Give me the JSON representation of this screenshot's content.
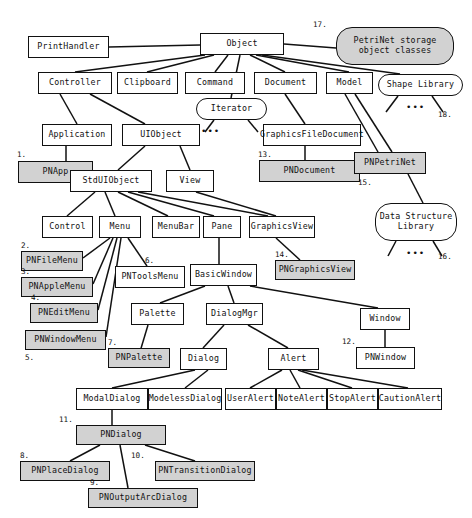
{
  "diagram": {
    "colors": {
      "highlight_fill": "#d2d2d2",
      "plain_fill": "#ffffff",
      "stroke": "#111111"
    },
    "nodes": [
      {
        "id": "PrintHandler",
        "label": "PrintHandler",
        "x": 28,
        "y": 36,
        "w": 81,
        "h": 22,
        "shape": "rect",
        "fill": "plain"
      },
      {
        "id": "Object",
        "label": "Object",
        "x": 200,
        "y": 33,
        "w": 84,
        "h": 22,
        "shape": "rect",
        "fill": "plain"
      },
      {
        "id": "PNStorage",
        "label": "PetriNet storage\nobject classes",
        "x": 336,
        "y": 27,
        "w": 118,
        "h": 38,
        "shape": "round2",
        "fill": "gray"
      },
      {
        "id": "Controller",
        "label": "Controller",
        "x": 38,
        "y": 72,
        "w": 74,
        "h": 22,
        "shape": "rect",
        "fill": "plain"
      },
      {
        "id": "Clipboard",
        "label": "Clipboard",
        "x": 117,
        "y": 72,
        "w": 61,
        "h": 22,
        "shape": "rect",
        "fill": "plain"
      },
      {
        "id": "Command",
        "label": "Command",
        "x": 185,
        "y": 72,
        "w": 60,
        "h": 22,
        "shape": "rect",
        "fill": "plain"
      },
      {
        "id": "Document",
        "label": "Document",
        "x": 254,
        "y": 72,
        "w": 63,
        "h": 22,
        "shape": "rect",
        "fill": "plain"
      },
      {
        "id": "Model",
        "label": "Model",
        "x": 326,
        "y": 72,
        "w": 47,
        "h": 22,
        "shape": "rect",
        "fill": "plain"
      },
      {
        "id": "ShapeLibrary",
        "label": "Shape Library",
        "x": 378,
        "y": 74,
        "w": 85,
        "h": 22,
        "shape": "round",
        "fill": "plain"
      },
      {
        "id": "Iterator",
        "label": "Iterator",
        "x": 196,
        "y": 98,
        "w": 71,
        "h": 22,
        "shape": "round",
        "fill": "plain"
      },
      {
        "id": "Application",
        "label": "Application",
        "x": 42,
        "y": 124,
        "w": 70,
        "h": 22,
        "shape": "rect",
        "fill": "plain"
      },
      {
        "id": "UIObject",
        "label": "UIObject",
        "x": 122,
        "y": 124,
        "w": 78,
        "h": 22,
        "shape": "rect",
        "fill": "plain"
      },
      {
        "id": "GraphicsFileDocument",
        "label": "GraphicsFileDocument",
        "x": 263,
        "y": 124,
        "w": 98,
        "h": 22,
        "shape": "rect",
        "fill": "plain"
      },
      {
        "id": "PNApp",
        "label": "PNApp",
        "x": 18,
        "y": 161,
        "w": 75,
        "h": 22,
        "shape": "rect",
        "fill": "gray"
      },
      {
        "id": "StdUIObject",
        "label": "StdUIObject",
        "x": 70,
        "y": 170,
        "w": 82,
        "h": 22,
        "shape": "rect",
        "fill": "plain"
      },
      {
        "id": "View",
        "label": "View",
        "x": 166,
        "y": 170,
        "w": 48,
        "h": 22,
        "shape": "rect",
        "fill": "plain"
      },
      {
        "id": "PNDocument",
        "label": "PNDocument",
        "x": 259,
        "y": 160,
        "w": 101,
        "h": 22,
        "shape": "rect",
        "fill": "gray"
      },
      {
        "id": "PNPetriNet",
        "label": "PNPetriNet",
        "x": 354,
        "y": 152,
        "w": 72,
        "h": 22,
        "shape": "rect",
        "fill": "gray"
      },
      {
        "id": "DataStructureLibrary",
        "label": "Data Structure\nLibrary",
        "x": 375,
        "y": 203,
        "w": 82,
        "h": 38,
        "shape": "round2",
        "fill": "plain"
      },
      {
        "id": "Control",
        "label": "Control",
        "x": 42,
        "y": 216,
        "w": 51,
        "h": 22,
        "shape": "rect",
        "fill": "plain"
      },
      {
        "id": "Menu",
        "label": "Menu",
        "x": 99,
        "y": 216,
        "w": 42,
        "h": 22,
        "shape": "rect",
        "fill": "plain"
      },
      {
        "id": "MenuBar",
        "label": "MenuBar",
        "x": 152,
        "y": 216,
        "w": 48,
        "h": 22,
        "shape": "rect",
        "fill": "plain"
      },
      {
        "id": "Pane",
        "label": "Pane",
        "x": 203,
        "y": 216,
        "w": 38,
        "h": 22,
        "shape": "rect",
        "fill": "plain"
      },
      {
        "id": "GraphicsView",
        "label": "GraphicsView",
        "x": 249,
        "y": 216,
        "w": 66,
        "h": 22,
        "shape": "rect",
        "fill": "plain"
      },
      {
        "id": "PNFileMenu",
        "label": "PNFileMenu",
        "x": 21,
        "y": 251,
        "w": 62,
        "h": 20,
        "shape": "rect",
        "fill": "gray"
      },
      {
        "id": "PNToolsMenu",
        "label": "PNToolsMenu",
        "x": 115,
        "y": 266,
        "w": 70,
        "h": 22,
        "shape": "rect",
        "fill": "plain"
      },
      {
        "id": "BasicWindow",
        "label": "BasicWindow",
        "x": 190,
        "y": 264,
        "w": 67,
        "h": 22,
        "shape": "rect",
        "fill": "plain"
      },
      {
        "id": "PNGraphicsView",
        "label": "PNGraphicsView",
        "x": 275,
        "y": 260,
        "w": 80,
        "h": 20,
        "shape": "rect",
        "fill": "gray"
      },
      {
        "id": "PNAppleMenu",
        "label": "PNAppleMenu",
        "x": 21,
        "y": 277,
        "w": 72,
        "h": 20,
        "shape": "rect",
        "fill": "gray"
      },
      {
        "id": "PNEditMenu",
        "label": "PNEditMenu",
        "x": 30,
        "y": 303,
        "w": 68,
        "h": 20,
        "shape": "rect",
        "fill": "gray"
      },
      {
        "id": "Palette",
        "label": "Palette",
        "x": 131,
        "y": 303,
        "w": 53,
        "h": 22,
        "shape": "rect",
        "fill": "plain"
      },
      {
        "id": "DialogMgr",
        "label": "DialogMgr",
        "x": 206,
        "y": 303,
        "w": 57,
        "h": 22,
        "shape": "rect",
        "fill": "plain"
      },
      {
        "id": "Window",
        "label": "Window",
        "x": 360,
        "y": 308,
        "w": 50,
        "h": 22,
        "shape": "rect",
        "fill": "plain"
      },
      {
        "id": "PNWindowMenu",
        "label": "PNWindowMenu",
        "x": 25,
        "y": 330,
        "w": 81,
        "h": 20,
        "shape": "rect",
        "fill": "gray"
      },
      {
        "id": "PNPalette",
        "label": "PNPalette",
        "x": 108,
        "y": 348,
        "w": 62,
        "h": 20,
        "shape": "rect",
        "fill": "gray"
      },
      {
        "id": "Dialog",
        "label": "Dialog",
        "x": 180,
        "y": 348,
        "w": 47,
        "h": 22,
        "shape": "rect",
        "fill": "plain"
      },
      {
        "id": "Alert",
        "label": "Alert",
        "x": 268,
        "y": 348,
        "w": 51,
        "h": 22,
        "shape": "rect",
        "fill": "plain"
      },
      {
        "id": "PNWindow",
        "label": "PNWindow",
        "x": 356,
        "y": 347,
        "w": 59,
        "h": 22,
        "shape": "rect",
        "fill": "plain"
      },
      {
        "id": "ModalDialog",
        "label": "ModalDialog",
        "x": 76,
        "y": 388,
        "w": 72,
        "h": 22,
        "shape": "rect",
        "fill": "plain"
      },
      {
        "id": "ModelessDialog",
        "label": "ModelessDialog",
        "x": 148,
        "y": 388,
        "w": 74,
        "h": 22,
        "shape": "rect",
        "fill": "plain"
      },
      {
        "id": "UserAlert",
        "label": "UserAlert",
        "x": 225,
        "y": 388,
        "w": 51,
        "h": 22,
        "shape": "rect",
        "fill": "plain"
      },
      {
        "id": "NoteAlert",
        "label": "NoteAlert",
        "x": 276,
        "y": 388,
        "w": 51,
        "h": 22,
        "shape": "rect",
        "fill": "plain"
      },
      {
        "id": "StopAlert",
        "label": "StopAlert",
        "x": 327,
        "y": 388,
        "w": 51,
        "h": 22,
        "shape": "rect",
        "fill": "plain"
      },
      {
        "id": "CautionAlert",
        "label": "CautionAlert",
        "x": 378,
        "y": 388,
        "w": 64,
        "h": 22,
        "shape": "rect",
        "fill": "plain"
      },
      {
        "id": "PNDialog",
        "label": "PNDialog",
        "x": 76,
        "y": 425,
        "w": 90,
        "h": 20,
        "shape": "rect",
        "fill": "gray"
      },
      {
        "id": "PNPlaceDialog",
        "label": "PNPlaceDialog",
        "x": 20,
        "y": 461,
        "w": 90,
        "h": 20,
        "shape": "rect",
        "fill": "gray"
      },
      {
        "id": "PNTransitionDialog",
        "label": "PNTransitionDialog",
        "x": 155,
        "y": 461,
        "w": 100,
        "h": 20,
        "shape": "rect",
        "fill": "gray"
      },
      {
        "id": "PNOutputArcDialog",
        "label": "PNOutputArcDialog",
        "x": 88,
        "y": 488,
        "w": 110,
        "h": 20,
        "shape": "rect",
        "fill": "gray"
      }
    ],
    "number_labels": [
      {
        "text": "1.",
        "x": 17,
        "y": 150
      },
      {
        "text": "2.",
        "x": 21,
        "y": 241
      },
      {
        "text": "3.",
        "x": 21,
        "y": 267
      },
      {
        "text": "4.",
        "x": 31,
        "y": 293
      },
      {
        "text": "5.",
        "x": 25,
        "y": 353
      },
      {
        "text": "6.",
        "x": 145,
        "y": 256
      },
      {
        "text": "7.",
        "x": 108,
        "y": 338
      },
      {
        "text": "8.",
        "x": 20,
        "y": 451
      },
      {
        "text": "9.",
        "x": 90,
        "y": 478
      },
      {
        "text": "10.",
        "x": 131,
        "y": 451
      },
      {
        "text": "11.",
        "x": 59,
        "y": 415
      },
      {
        "text": "12.",
        "x": 342,
        "y": 337
      },
      {
        "text": "13.",
        "x": 258,
        "y": 150
      },
      {
        "text": "14.",
        "x": 275,
        "y": 250
      },
      {
        "text": "15.",
        "x": 358,
        "y": 178
      },
      {
        "text": "16.",
        "x": 438,
        "y": 252
      },
      {
        "text": "17.",
        "x": 313,
        "y": 20
      },
      {
        "text": "18.",
        "x": 438,
        "y": 110
      }
    ],
    "ellipses_markers": [
      {
        "text": "•••",
        "x": 201,
        "y": 126
      },
      {
        "text": "•••",
        "x": 406,
        "y": 102
      },
      {
        "text": "•••",
        "x": 406,
        "y": 248
      }
    ],
    "edges": [
      {
        "from": "Object",
        "to": "PrintHandler",
        "x1": 200,
        "y1": 45,
        "x2": 109,
        "y2": 47
      },
      {
        "from": "Object",
        "to": "Controller",
        "x1": 205,
        "y1": 55,
        "x2": 75,
        "y2": 72
      },
      {
        "from": "Object",
        "to": "Clipboard",
        "x1": 214,
        "y1": 55,
        "x2": 147,
        "y2": 72
      },
      {
        "from": "Object",
        "to": "Command",
        "x1": 228,
        "y1": 55,
        "x2": 215,
        "y2": 72
      },
      {
        "from": "Object",
        "to": "Iterator",
        "x1": 240,
        "y1": 55,
        "x2": 231,
        "y2": 98
      },
      {
        "from": "Object",
        "to": "Document",
        "x1": 250,
        "y1": 55,
        "x2": 285,
        "y2": 72
      },
      {
        "from": "Object",
        "to": "Model",
        "x1": 256,
        "y1": 55,
        "x2": 349,
        "y2": 72
      },
      {
        "from": "Object",
        "to": "ShapeLibrary",
        "x1": 262,
        "y1": 55,
        "x2": 400,
        "y2": 74
      },
      {
        "from": "Object",
        "to": "PNStorage",
        "x1": 284,
        "y1": 44,
        "x2": 336,
        "y2": 48
      },
      {
        "from": "Controller",
        "to": "Application",
        "x1": 60,
        "y1": 94,
        "x2": 77,
        "y2": 124
      },
      {
        "from": "Controller",
        "to": "UIObject",
        "x1": 90,
        "y1": 94,
        "x2": 145,
        "y2": 124
      },
      {
        "from": "Document",
        "to": "GraphicsFileDocument",
        "x1": 285,
        "y1": 94,
        "x2": 305,
        "y2": 124
      },
      {
        "from": "Model",
        "to": "PNPetriNet",
        "x1": 345,
        "y1": 94,
        "x2": 378,
        "y2": 152
      },
      {
        "from": "Model",
        "to": "PNPetriNet2",
        "x1": 355,
        "y1": 94,
        "x2": 392,
        "y2": 152
      },
      {
        "from": "ShapeLibrary",
        "to": "dots1",
        "x1": 398,
        "y1": 96,
        "x2": 386,
        "y2": 112
      },
      {
        "from": "ShapeLibrary",
        "to": "dots2",
        "x1": 432,
        "y1": 96,
        "x2": 443,
        "y2": 112
      },
      {
        "from": "Iterator",
        "to": "dots3",
        "x1": 214,
        "y1": 120,
        "x2": 205,
        "y2": 132
      },
      {
        "from": "Iterator",
        "to": "dots4",
        "x1": 248,
        "y1": 120,
        "x2": 258,
        "y2": 132
      },
      {
        "from": "Application",
        "to": "PNApp",
        "x1": 66,
        "y1": 146,
        "x2": 66,
        "y2": 161
      },
      {
        "from": "UIObject",
        "to": "StdUIObject",
        "x1": 145,
        "y1": 146,
        "x2": 118,
        "y2": 170
      },
      {
        "from": "UIObject",
        "to": "View",
        "x1": 180,
        "y1": 146,
        "x2": 190,
        "y2": 170
      },
      {
        "from": "StdUIObject",
        "to": "PNApp",
        "x1": 93,
        "y1": 175,
        "x2": 70,
        "y2": 175
      },
      {
        "from": "GraphicsFileDocument",
        "to": "PNDocument",
        "x1": 305,
        "y1": 146,
        "x2": 305,
        "y2": 160
      },
      {
        "from": "PNPetriNet",
        "to": "DataStructureLibrary",
        "x1": 408,
        "y1": 174,
        "x2": 423,
        "y2": 203
      },
      {
        "from": "DataStructureLibrary",
        "to": "dots5",
        "x1": 396,
        "y1": 241,
        "x2": 388,
        "y2": 256
      },
      {
        "from": "DataStructureLibrary",
        "to": "dots6",
        "x1": 433,
        "y1": 241,
        "x2": 442,
        "y2": 256
      },
      {
        "from": "StdUIObject",
        "to": "Control",
        "x1": 95,
        "y1": 192,
        "x2": 67,
        "y2": 216
      },
      {
        "from": "StdUIObject",
        "to": "Menu",
        "x1": 105,
        "y1": 192,
        "x2": 115,
        "y2": 216
      },
      {
        "from": "StdUIObject",
        "to": "MenuBar",
        "x1": 118,
        "y1": 192,
        "x2": 168,
        "y2": 216
      },
      {
        "from": "StdUIObject",
        "to": "Pane",
        "x1": 128,
        "y1": 192,
        "x2": 214,
        "y2": 216
      },
      {
        "from": "StdUIObject",
        "to": "GraphicsView",
        "x1": 138,
        "y1": 192,
        "x2": 268,
        "y2": 216
      },
      {
        "from": "View",
        "to": "GraphicsView",
        "x1": 196,
        "y1": 192,
        "x2": 276,
        "y2": 216
      },
      {
        "from": "Menu",
        "to": "PNFileMenu",
        "x1": 110,
        "y1": 238,
        "x2": 83,
        "y2": 258
      },
      {
        "from": "Menu",
        "to": "PNAppleMenu",
        "x1": 113,
        "y1": 238,
        "x2": 93,
        "y2": 284
      },
      {
        "from": "Menu",
        "to": "PNEditMenu",
        "x1": 117,
        "y1": 238,
        "x2": 98,
        "y2": 310
      },
      {
        "from": "Menu",
        "to": "PNWindowMenu",
        "x1": 121,
        "y1": 238,
        "x2": 106,
        "y2": 337
      },
      {
        "from": "Menu",
        "to": "PNToolsMenu",
        "x1": 128,
        "y1": 238,
        "x2": 147,
        "y2": 266
      },
      {
        "from": "Pane",
        "to": "BasicWindow",
        "x1": 219,
        "y1": 238,
        "x2": 219,
        "y2": 264
      },
      {
        "from": "GraphicsView",
        "to": "PNGraphicsView",
        "x1": 276,
        "y1": 238,
        "x2": 300,
        "y2": 260
      },
      {
        "from": "BasicWindow",
        "to": "Palette",
        "x1": 205,
        "y1": 286,
        "x2": 160,
        "y2": 303
      },
      {
        "from": "BasicWindow",
        "to": "DialogMgr",
        "x1": 228,
        "y1": 286,
        "x2": 234,
        "y2": 303
      },
      {
        "from": "BasicWindow",
        "to": "Window",
        "x1": 250,
        "y1": 286,
        "x2": 378,
        "y2": 308
      },
      {
        "from": "Palette",
        "to": "PNPalette",
        "x1": 148,
        "y1": 325,
        "x2": 139,
        "y2": 355
      },
      {
        "from": "DialogMgr",
        "to": "Dialog",
        "x1": 224,
        "y1": 325,
        "x2": 203,
        "y2": 348
      },
      {
        "from": "DialogMgr",
        "to": "Alert",
        "x1": 248,
        "y1": 325,
        "x2": 288,
        "y2": 348
      },
      {
        "from": "Window",
        "to": "PNWindow",
        "x1": 385,
        "y1": 330,
        "x2": 385,
        "y2": 347
      },
      {
        "from": "Dialog",
        "to": "ModalDialog",
        "x1": 195,
        "y1": 370,
        "x2": 112,
        "y2": 388
      },
      {
        "from": "Dialog",
        "to": "ModelessDialog",
        "x1": 208,
        "y1": 370,
        "x2": 185,
        "y2": 388
      },
      {
        "from": "Alert",
        "to": "UserAlert",
        "x1": 282,
        "y1": 370,
        "x2": 250,
        "y2": 388
      },
      {
        "from": "Alert",
        "to": "NoteAlert",
        "x1": 290,
        "y1": 370,
        "x2": 300,
        "y2": 388
      },
      {
        "from": "Alert",
        "to": "StopAlert",
        "x1": 298,
        "y1": 370,
        "x2": 352,
        "y2": 388
      },
      {
        "from": "Alert",
        "to": "CautionAlert",
        "x1": 302,
        "y1": 370,
        "x2": 408,
        "y2": 388
      },
      {
        "from": "ModalDialog",
        "to": "PNDialog",
        "x1": 112,
        "y1": 410,
        "x2": 112,
        "y2": 425
      },
      {
        "from": "PNDialog",
        "to": "PNPlaceDialog",
        "x1": 100,
        "y1": 445,
        "x2": 70,
        "y2": 461
      },
      {
        "from": "PNDialog",
        "to": "PNOutputArcDialog",
        "x1": 120,
        "y1": 445,
        "x2": 128,
        "y2": 488
      },
      {
        "from": "PNDialog",
        "to": "PNTransitionDialog",
        "x1": 145,
        "y1": 445,
        "x2": 195,
        "y2": 461
      }
    ]
  }
}
